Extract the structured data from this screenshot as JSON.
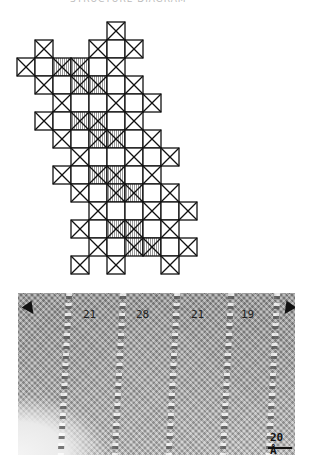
{
  "caption": "STRUCTURE DIAGRAM",
  "diagram": {
    "origin_x": 17,
    "origin_y": 22,
    "cell": 18,
    "stroke": "#111111",
    "hatch_fill": "#d8d8d8",
    "cells": [
      {
        "r": 0,
        "c": 5,
        "t": "x"
      },
      {
        "r": 1,
        "c": 1,
        "t": "x"
      },
      {
        "r": 1,
        "c": 4,
        "t": "x"
      },
      {
        "r": 1,
        "c": 5,
        "t": "o"
      },
      {
        "r": 1,
        "c": 6,
        "t": "x"
      },
      {
        "r": 2,
        "c": 0,
        "t": "x"
      },
      {
        "r": 2,
        "c": 1,
        "t": "o"
      },
      {
        "r": 2,
        "c": 2,
        "t": "h"
      },
      {
        "r": 2,
        "c": 3,
        "t": "h"
      },
      {
        "r": 2,
        "c": 4,
        "t": "o"
      },
      {
        "r": 2,
        "c": 5,
        "t": "x"
      },
      {
        "r": 3,
        "c": 1,
        "t": "x"
      },
      {
        "r": 3,
        "c": 2,
        "t": "o"
      },
      {
        "r": 3,
        "c": 3,
        "t": "h"
      },
      {
        "r": 3,
        "c": 4,
        "t": "h"
      },
      {
        "r": 3,
        "c": 5,
        "t": "o"
      },
      {
        "r": 3,
        "c": 6,
        "t": "x"
      },
      {
        "r": 4,
        "c": 2,
        "t": "x"
      },
      {
        "r": 4,
        "c": 3,
        "t": "o"
      },
      {
        "r": 4,
        "c": 4,
        "t": "o"
      },
      {
        "r": 4,
        "c": 5,
        "t": "x"
      },
      {
        "r": 4,
        "c": 6,
        "t": "o"
      },
      {
        "r": 4,
        "c": 7,
        "t": "x"
      },
      {
        "r": 5,
        "c": 1,
        "t": "x"
      },
      {
        "r": 5,
        "c": 2,
        "t": "o"
      },
      {
        "r": 5,
        "c": 3,
        "t": "h"
      },
      {
        "r": 5,
        "c": 4,
        "t": "h"
      },
      {
        "r": 5,
        "c": 5,
        "t": "o"
      },
      {
        "r": 5,
        "c": 6,
        "t": "x"
      },
      {
        "r": 6,
        "c": 2,
        "t": "x"
      },
      {
        "r": 6,
        "c": 3,
        "t": "o"
      },
      {
        "r": 6,
        "c": 4,
        "t": "h"
      },
      {
        "r": 6,
        "c": 5,
        "t": "h"
      },
      {
        "r": 6,
        "c": 6,
        "t": "o"
      },
      {
        "r": 6,
        "c": 7,
        "t": "x"
      },
      {
        "r": 7,
        "c": 3,
        "t": "x"
      },
      {
        "r": 7,
        "c": 4,
        "t": "o"
      },
      {
        "r": 7,
        "c": 5,
        "t": "o"
      },
      {
        "r": 7,
        "c": 6,
        "t": "x"
      },
      {
        "r": 7,
        "c": 7,
        "t": "o"
      },
      {
        "r": 7,
        "c": 8,
        "t": "x"
      },
      {
        "r": 8,
        "c": 2,
        "t": "x"
      },
      {
        "r": 8,
        "c": 3,
        "t": "o"
      },
      {
        "r": 8,
        "c": 4,
        "t": "h"
      },
      {
        "r": 8,
        "c": 5,
        "t": "h"
      },
      {
        "r": 8,
        "c": 6,
        "t": "o"
      },
      {
        "r": 8,
        "c": 7,
        "t": "x"
      },
      {
        "r": 9,
        "c": 3,
        "t": "x"
      },
      {
        "r": 9,
        "c": 4,
        "t": "o"
      },
      {
        "r": 9,
        "c": 5,
        "t": "h"
      },
      {
        "r": 9,
        "c": 6,
        "t": "h"
      },
      {
        "r": 9,
        "c": 7,
        "t": "o"
      },
      {
        "r": 9,
        "c": 8,
        "t": "x"
      },
      {
        "r": 10,
        "c": 4,
        "t": "x"
      },
      {
        "r": 10,
        "c": 5,
        "t": "o"
      },
      {
        "r": 10,
        "c": 6,
        "t": "o"
      },
      {
        "r": 10,
        "c": 7,
        "t": "x"
      },
      {
        "r": 10,
        "c": 8,
        "t": "o"
      },
      {
        "r": 10,
        "c": 9,
        "t": "x"
      },
      {
        "r": 11,
        "c": 3,
        "t": "x"
      },
      {
        "r": 11,
        "c": 4,
        "t": "o"
      },
      {
        "r": 11,
        "c": 5,
        "t": "h"
      },
      {
        "r": 11,
        "c": 6,
        "t": "h"
      },
      {
        "r": 11,
        "c": 7,
        "t": "o"
      },
      {
        "r": 11,
        "c": 8,
        "t": "x"
      },
      {
        "r": 12,
        "c": 4,
        "t": "x"
      },
      {
        "r": 12,
        "c": 5,
        "t": "o"
      },
      {
        "r": 12,
        "c": 6,
        "t": "h"
      },
      {
        "r": 12,
        "c": 7,
        "t": "h"
      },
      {
        "r": 12,
        "c": 8,
        "t": "o"
      },
      {
        "r": 12,
        "c": 9,
        "t": "x"
      },
      {
        "r": 13,
        "c": 3,
        "t": "x"
      },
      {
        "r": 13,
        "c": 5,
        "t": "x"
      },
      {
        "r": 13,
        "c": 8,
        "t": "x"
      }
    ]
  },
  "micrograph": {
    "labels": [
      {
        "text": "21",
        "x": 65
      },
      {
        "text": "28",
        "x": 118
      },
      {
        "text": "21",
        "x": 173
      },
      {
        "text": "19",
        "x": 223
      }
    ],
    "stripes_x": [
      44,
      98,
      152,
      206,
      252
    ],
    "scale_label": "20 Å"
  }
}
